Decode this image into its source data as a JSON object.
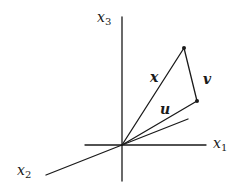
{
  "diagram": {
    "type": "vector-decomposition-3d",
    "axes": {
      "x1": {
        "label": "x",
        "subscript": "1"
      },
      "x2": {
        "label": "x",
        "subscript": "2"
      },
      "x3": {
        "label": "x",
        "subscript": "3"
      }
    },
    "vectors": {
      "x": {
        "label": "x"
      },
      "u": {
        "label": "u"
      },
      "v": {
        "label": "v"
      }
    },
    "colors": {
      "stroke": "#1a1a1a",
      "background": "#ffffff"
    }
  }
}
